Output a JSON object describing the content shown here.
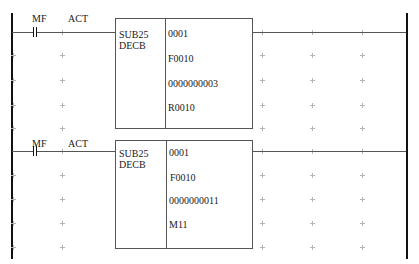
{
  "diagram": {
    "type": "ladder-logic",
    "rungs": [
      {
        "contact": {
          "label": "MF",
          "type": "normally-open"
        },
        "coil_label": "ACT",
        "function_block": {
          "name": "SUB25",
          "instruction": "DECB",
          "operands": [
            "0001",
            "F0010",
            "0000000003",
            "R0010"
          ]
        }
      },
      {
        "contact": {
          "label": "MF",
          "type": "normally-open"
        },
        "coil_label": "ACT",
        "function_block": {
          "name": "SUB25",
          "instruction": "DECB",
          "operands": [
            "0001",
            "F0010",
            "0000000011",
            "M11"
          ]
        }
      }
    ]
  },
  "colors": {
    "rail": "#111111",
    "wire": "#555555",
    "grid_cross": "#b5b5b5",
    "text": "#1a1a1a"
  }
}
